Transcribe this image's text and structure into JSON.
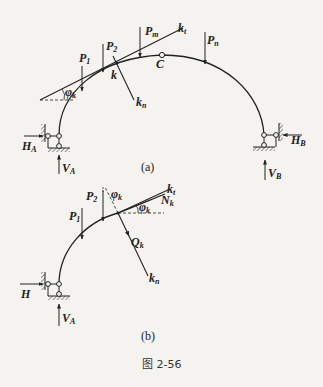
{
  "figure": {
    "caption": "图 2-56",
    "colors": {
      "background": "#f4f3f0",
      "ink": "#222222"
    }
  },
  "panel_a": {
    "label": "(a)",
    "hinge_label": "C",
    "point_label": "k",
    "tangent_label": {
      "main": "k",
      "sub": "t"
    },
    "normal_label": {
      "main": "k",
      "sub": "n"
    },
    "angle_label": {
      "main": "φ",
      "sub": "k"
    },
    "loads": [
      {
        "main": "P",
        "sub": "1"
      },
      {
        "main": "P",
        "sub": "2"
      },
      {
        "main": "P",
        "sub": "m"
      },
      {
        "main": "P",
        "sub": "n"
      }
    ],
    "reactions": {
      "HA": {
        "main": "H",
        "sub": "A"
      },
      "VA": {
        "main": "V",
        "sub": "A"
      },
      "HB": {
        "main": "H",
        "sub": "B"
      },
      "VB": {
        "main": "V",
        "sub": "B"
      }
    }
  },
  "panel_b": {
    "label": "(b)",
    "tangent_label": {
      "main": "k",
      "sub": "t"
    },
    "normal_label": {
      "main": "k",
      "sub": "n"
    },
    "axial_label": {
      "main": "N",
      "sub": "k"
    },
    "shear_label": {
      "main": "Q",
      "sub": "k"
    },
    "angle_label_top": {
      "main": "φ",
      "sub": "k"
    },
    "angle_label_right": {
      "main": "φ",
      "sub": "k"
    },
    "loads": [
      {
        "main": "P",
        "sub": "1"
      },
      {
        "main": "P",
        "sub": "2"
      }
    ],
    "reactions": {
      "H": {
        "main": "H"
      },
      "VA": {
        "main": "V",
        "sub": "A"
      }
    }
  }
}
